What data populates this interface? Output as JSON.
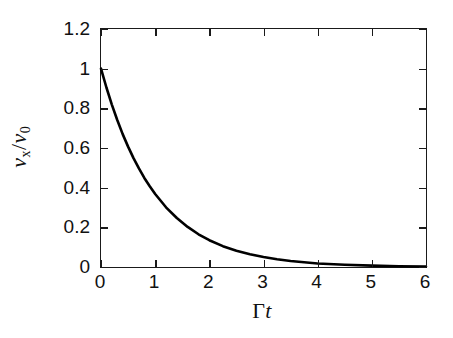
{
  "figure": {
    "background_color": "#ffffff",
    "axis_color": "#1a1a1a",
    "curve_color": "#000000"
  },
  "chart_data": {
    "type": "line",
    "title": "",
    "subtitle": "",
    "xlabel": "Γt",
    "xlabel_parts": {
      "upright": "Γ",
      "italic": "t"
    },
    "ylabel": "v_x/v_0",
    "ylabel_parts": {
      "v": "v",
      "sub_x": "x",
      "slash": "/",
      "v2": "v",
      "sub_0": "0"
    },
    "xlim": [
      0,
      6
    ],
    "ylim": [
      0,
      1.2
    ],
    "xticks": [
      0,
      1,
      2,
      3,
      4,
      5,
      6
    ],
    "yticks": [
      0,
      0.2,
      0.4,
      0.6,
      0.8,
      1.0,
      1.2
    ],
    "xticklabels": [
      "0",
      "1",
      "2",
      "3",
      "4",
      "5",
      "6"
    ],
    "yticklabels": [
      "0",
      "0.2",
      "0.4",
      "0.6",
      "0.8",
      "1",
      "1.2"
    ],
    "grid": false,
    "legend": null,
    "annotations": [],
    "frame": "full-box",
    "tick_direction": "in",
    "series": [
      {
        "name": "v_x/v_0 = exp(-Γt)",
        "equation": "exp(-x)",
        "line_width_px": 2.6,
        "color": "#000000",
        "x": [
          0,
          0.1,
          0.2,
          0.3,
          0.4,
          0.5,
          0.6,
          0.7,
          0.8,
          0.9,
          1.0,
          1.2,
          1.4,
          1.6,
          1.8,
          2.0,
          2.25,
          2.5,
          2.75,
          3.0,
          3.25,
          3.5,
          3.75,
          4.0,
          4.5,
          5.0,
          5.5,
          6.0
        ],
        "values": [
          1.0,
          0.905,
          0.819,
          0.741,
          0.67,
          0.607,
          0.549,
          0.497,
          0.449,
          0.407,
          0.368,
          0.301,
          0.247,
          0.202,
          0.165,
          0.135,
          0.105,
          0.082,
          0.064,
          0.05,
          0.039,
          0.03,
          0.024,
          0.018,
          0.011,
          0.0067,
          0.0041,
          0.0025
        ]
      }
    ]
  }
}
